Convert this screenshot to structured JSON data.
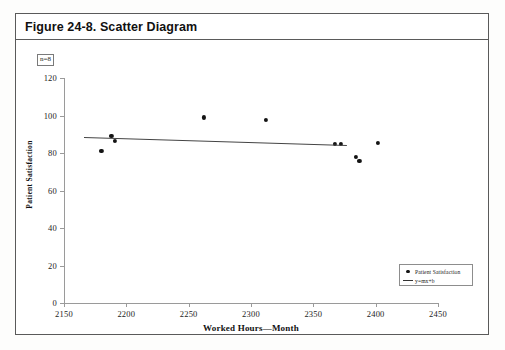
{
  "figure": {
    "title": "Figure 24-8. Scatter Diagram",
    "sample_size_label": "n=8"
  },
  "legend": {
    "position": "bottom-right",
    "entries": [
      {
        "label": "Patient Satisfaction",
        "marker": "dot"
      },
      {
        "label": "y=mx+b",
        "marker": "line"
      }
    ]
  },
  "chart_data": {
    "type": "scatter",
    "title": "Figure 24-8. Scatter Diagram",
    "xlabel": "Worked Hours—Month",
    "ylabel": "Patient Satisfaction",
    "xlim": [
      2150,
      2450
    ],
    "ylim": [
      0,
      120
    ],
    "xticks": [
      2150,
      2200,
      2250,
      2300,
      2350,
      2400,
      2450
    ],
    "yticks": [
      0,
      20,
      40,
      60,
      80,
      100,
      120
    ],
    "xtick_labels": [
      "2150",
      "2200",
      "2250",
      "2300",
      "2350",
      "2400",
      "2450"
    ],
    "ytick_labels": [
      "0",
      "20",
      "40",
      "60",
      "80",
      "100",
      "120"
    ],
    "grid": false,
    "annotations": [
      "n=8"
    ],
    "series": [
      {
        "name": "Patient Satisfaction",
        "marker": "dot",
        "color": "#141414",
        "points": [
          {
            "x": 2180,
            "y": 81
          },
          {
            "x": 2188,
            "y": 89
          },
          {
            "x": 2191,
            "y": 86.5
          },
          {
            "x": 2262,
            "y": 99
          },
          {
            "x": 2312,
            "y": 97.5
          },
          {
            "x": 2367,
            "y": 85
          },
          {
            "x": 2372,
            "y": 85
          },
          {
            "x": 2384,
            "y": 78
          },
          {
            "x": 2387,
            "y": 76
          },
          {
            "x": 2402,
            "y": 85.5
          }
        ]
      },
      {
        "name": "y=mx+b",
        "type": "trendline",
        "color": "#444444",
        "x_start": 2166,
        "y_start": 88.5,
        "x_end": 2377,
        "y_end": 84.2
      }
    ]
  }
}
